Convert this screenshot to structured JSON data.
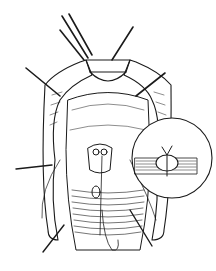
{
  "figure": {
    "type": "surgical-line-illustration",
    "style": "black ink line drawing on white",
    "colors": {
      "ink": "#1a1a1a",
      "background": "#ffffff"
    },
    "main_subject": "retracted tubular organ with surgical exposure and sutures",
    "inset": {
      "shape": "circle",
      "depicts": "cross-section of tissue layers with suture loop and knot"
    }
  }
}
